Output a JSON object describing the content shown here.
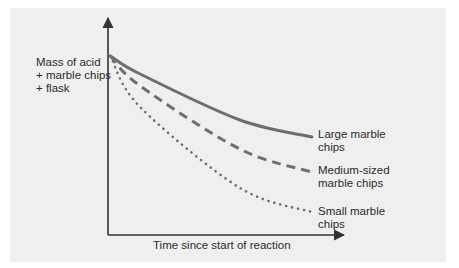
{
  "chart_data": {
    "type": "line",
    "title": "",
    "xlabel": "Time since start of reaction",
    "ylabel": "Mass of acid\n+ marble chips\n+ flask",
    "ylabel_lines": [
      "Mass of acid",
      "+ marble chips",
      "+ flask"
    ],
    "xlim": [
      0,
      100
    ],
    "ylim": [
      0,
      100
    ],
    "grid": false,
    "ticks": "none (qualitative axes, values estimated on a 0-100 normalized scale)",
    "legend_position": "inline at right end of each curve",
    "series": [
      {
        "name": "Large marble chips",
        "label_lines": [
          "Large marble",
          "chips"
        ],
        "style": "solid",
        "color": "#6e6e6e",
        "x": [
          1,
          13.6,
          55.9,
          86.4
        ],
        "values": [
          82.5,
          74.2,
          53.0,
          45.2
        ]
      },
      {
        "name": "Medium-sized marble chips",
        "label_lines": [
          "Medium-sized",
          "marble chips"
        ],
        "style": "dashed",
        "color": "#6e6e6e",
        "x": [
          1,
          13.6,
          55.9,
          86.4
        ],
        "values": [
          82.5,
          68.7,
          39.6,
          29.0
        ]
      },
      {
        "name": "Small marble chips",
        "label_lines": [
          "Small marble",
          "chips"
        ],
        "style": "dotted",
        "color": "#6e6e6e",
        "x": [
          1,
          13.6,
          55.9,
          86.4
        ],
        "values": [
          82.5,
          59.0,
          21.7,
          10.6
        ]
      }
    ]
  },
  "colors": {
    "background_panel": "#efefef",
    "axis": "#333333",
    "curves": "#6e6e6e",
    "text": "#2b2b2b"
  }
}
